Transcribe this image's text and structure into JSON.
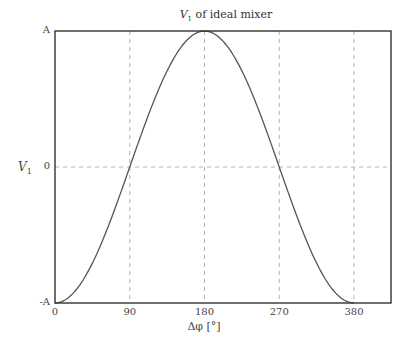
{
  "chart_data": {
    "type": "line",
    "title_var": "V",
    "title_sub": "1",
    "title_rest": " of ideal mixer",
    "xlabel": "Δφ [°]",
    "ylabel_var": "V",
    "ylabel_sub": "1",
    "xlim": [
      0,
      400
    ],
    "ylim": [
      -1,
      1
    ],
    "x_ticks": [
      {
        "value": 0,
        "label": "0"
      },
      {
        "value": 90,
        "label": "90"
      },
      {
        "value": 180,
        "label": "180"
      },
      {
        "value": 270,
        "label": "270"
      },
      {
        "value": 360,
        "label": "380"
      }
    ],
    "y_ticks": [
      {
        "value": -1,
        "label": "-A"
      },
      {
        "value": 0,
        "label": "0"
      },
      {
        "value": 1,
        "label": "A"
      }
    ],
    "grid": "dashed at x=90,180,270,360 and y=0",
    "series": [
      {
        "name": "V1",
        "formula": "-A*cos(Δφ)",
        "x": [
          0,
          45,
          90,
          135,
          180,
          225,
          270,
          315,
          360
        ],
        "y": [
          -1,
          -0.707,
          0,
          0.707,
          1,
          0.707,
          0,
          -0.707,
          -1
        ]
      }
    ],
    "colors": {
      "curve": "#555555",
      "grid": "#aaaaaa",
      "axes": "#333333"
    }
  }
}
